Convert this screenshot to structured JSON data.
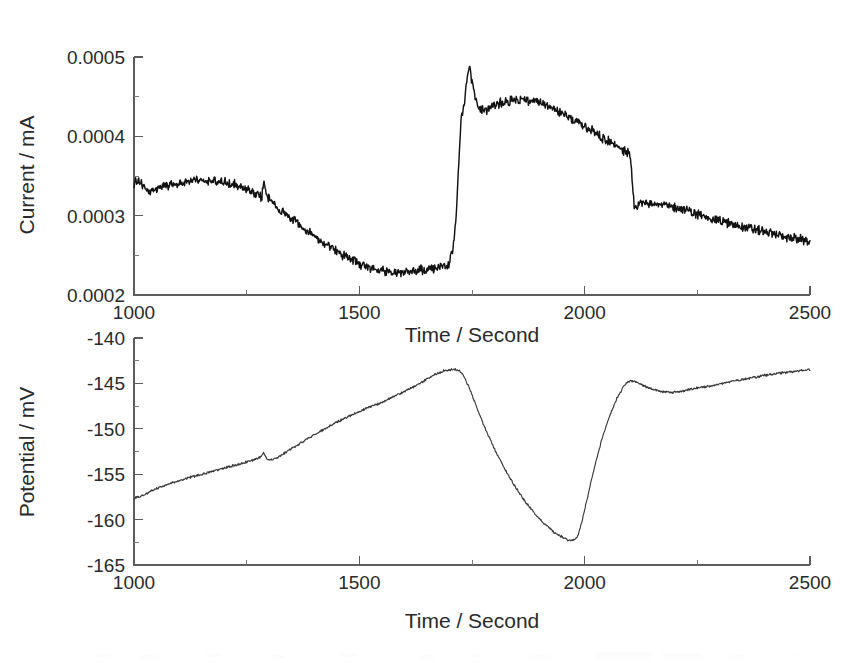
{
  "figure": {
    "background_color": "#ffffff",
    "trace_color": "#121212",
    "axis_color": "#5d5d5d",
    "panel_count": 2
  },
  "chart_data": [
    {
      "type": "line",
      "panel": "top",
      "title": "",
      "xlabel": "Time / Second",
      "ylabel": "Current / mA",
      "xlim": [
        1000,
        2500
      ],
      "ylim": [
        0.0002,
        0.0005
      ],
      "xticks": [
        1000,
        1500,
        2000,
        2500
      ],
      "xtick_labels": [
        "1000",
        "1500",
        "2000",
        "2500"
      ],
      "yticks": [
        0.0002,
        0.0003,
        0.0004,
        0.0005
      ],
      "ytick_labels": [
        "0.0002",
        "0.0003",
        "0.0004",
        "0.0005"
      ],
      "xminor_ticks": [
        1250,
        1750,
        2250
      ],
      "yminor_ticks": [
        0.00025,
        0.00035,
        0.00045
      ],
      "grid": false,
      "legend": "none",
      "noise_amplitude_mA": 5.5e-06,
      "series": [
        {
          "name": "Current",
          "x": [
            1000,
            1010,
            1020,
            1030,
            1045,
            1060,
            1080,
            1100,
            1120,
            1140,
            1160,
            1180,
            1200,
            1220,
            1240,
            1255,
            1270,
            1283,
            1288,
            1292,
            1300,
            1315,
            1335,
            1355,
            1380,
            1405,
            1430,
            1455,
            1480,
            1505,
            1530,
            1555,
            1580,
            1605,
            1630,
            1655,
            1675,
            1690,
            1700,
            1708,
            1715,
            1720,
            1726,
            1732,
            1738,
            1744,
            1752,
            1762,
            1775,
            1790,
            1805,
            1825,
            1845,
            1865,
            1885,
            1905,
            1925,
            1945,
            1965,
            1985,
            2005,
            2025,
            2045,
            2065,
            2085,
            2095,
            2100,
            2104,
            2110,
            2125,
            2145,
            2165,
            2185,
            2205,
            2230,
            2255,
            2285,
            2315,
            2345,
            2375,
            2405,
            2435,
            2465,
            2500
          ],
          "y": [
            0.00034,
            0.000344,
            0.000336,
            0.000329,
            0.000333,
            0.000336,
            0.000339,
            0.000341,
            0.000344,
            0.000345,
            0.000344,
            0.000343,
            0.000342,
            0.000339,
            0.000336,
            0.000332,
            0.000327,
            0.000322,
            0.000344,
            0.00033,
            0.000321,
            0.000313,
            0.000303,
            0.000294,
            0.000283,
            0.000272,
            0.000262,
            0.000253,
            0.000245,
            0.000238,
            0.000233,
            0.00023,
            0.000229,
            0.000229,
            0.000231,
            0.000233,
            0.000234,
            0.000236,
            0.00024,
            0.000258,
            0.0003,
            0.00036,
            0.000424,
            0.000436,
            0.000468,
            0.000491,
            0.000462,
            0.000438,
            0.000432,
            0.000436,
            0.000441,
            0.000444,
            0.000446,
            0.000446,
            0.000444,
            0.000441,
            0.000436,
            0.00043,
            0.000424,
            0.000418,
            0.000411,
            0.000404,
            0.000397,
            0.00039,
            0.000383,
            0.000379,
            0.000376,
            0.000356,
            0.000308,
            0.000316,
            0.000317,
            0.000315,
            0.000312,
            0.00031,
            0.000306,
            0.000301,
            0.000296,
            0.000291,
            0.000287,
            0.000283,
            0.000279,
            0.000275,
            0.000271,
            0.000268
          ]
        }
      ],
      "features": [
        {
          "label": "initial plateau",
          "t_range": [
            1000,
            1250
          ],
          "value_mA": 0.000342
        },
        {
          "label": "upward current spike",
          "t": 1288,
          "value_mA": 0.000344
        },
        {
          "label": "decay to minimum",
          "t_range": [
            1290,
            1600
          ],
          "value_mA": 0.000229
        },
        {
          "label": "sharp step rise",
          "t_range": [
            1705,
            1744
          ],
          "value_mA": 0.000491
        },
        {
          "label": "peak maximum",
          "t": 1744,
          "value_mA": 0.000491
        },
        {
          "label": "broad secondary maximum",
          "t_range": [
            1840,
            1870
          ],
          "value_mA": 0.000446
        },
        {
          "label": "downward current spike",
          "t": 2100,
          "value_mA": 0.000308
        },
        {
          "label": "final value",
          "t": 2500,
          "value_mA": 0.000268
        }
      ]
    },
    {
      "type": "line",
      "panel": "bottom",
      "title": "",
      "xlabel": "Time / Second",
      "ylabel": "Potential / mV",
      "xlim": [
        1000,
        2500
      ],
      "ylim": [
        -165,
        -140
      ],
      "xticks": [
        1000,
        1500,
        2000,
        2500
      ],
      "xtick_labels": [
        "1000",
        "1500",
        "2000",
        "2500"
      ],
      "yticks": [
        -165,
        -160,
        -155,
        -150,
        -145,
        -140
      ],
      "ytick_labels": [
        "-165",
        "-160",
        "-155",
        "-150",
        "-145",
        "-140"
      ],
      "xminor_ticks": [
        1250,
        1750,
        2250
      ],
      "yminor_ticks": [
        -162.5,
        -157.5,
        -152.5,
        -147.5,
        -142.5
      ],
      "grid": false,
      "legend": "none",
      "noise_amplitude_mV": 0.12,
      "series": [
        {
          "name": "Potential",
          "x": [
            1000,
            1020,
            1045,
            1070,
            1095,
            1120,
            1150,
            1180,
            1210,
            1240,
            1265,
            1282,
            1288,
            1294,
            1302,
            1315,
            1330,
            1350,
            1372,
            1395,
            1420,
            1445,
            1470,
            1495,
            1520,
            1545,
            1570,
            1595,
            1620,
            1645,
            1668,
            1688,
            1700,
            1712,
            1722,
            1732,
            1745,
            1760,
            1778,
            1798,
            1820,
            1845,
            1868,
            1890,
            1912,
            1932,
            1950,
            1962,
            1972,
            1978,
            1985,
            1995,
            2008,
            2022,
            2038,
            2055,
            2072,
            2088,
            2100,
            2112,
            2128,
            2148,
            2168,
            2190,
            2215,
            2240,
            2265,
            2295,
            2325,
            2355,
            2390,
            2425,
            2460,
            2500
          ],
          "y": [
            -157.7,
            -157.3,
            -156.7,
            -156.2,
            -155.8,
            -155.4,
            -155.0,
            -154.6,
            -154.2,
            -153.8,
            -153.4,
            -153.1,
            -152.6,
            -153.3,
            -153.4,
            -153.2,
            -152.8,
            -152.2,
            -151.5,
            -150.8,
            -150.1,
            -149.4,
            -148.8,
            -148.2,
            -147.6,
            -147.2,
            -146.6,
            -146.0,
            -145.4,
            -144.7,
            -144.0,
            -143.6,
            -143.5,
            -143.5,
            -143.6,
            -144.2,
            -145.6,
            -147.6,
            -149.8,
            -152.0,
            -154.2,
            -156.3,
            -158.0,
            -159.4,
            -160.5,
            -161.4,
            -161.9,
            -162.2,
            -162.3,
            -162.2,
            -161.8,
            -160.0,
            -157.2,
            -154.2,
            -151.2,
            -148.6,
            -146.6,
            -145.2,
            -144.7,
            -144.8,
            -145.2,
            -145.6,
            -145.9,
            -146.0,
            -145.9,
            -145.6,
            -145.4,
            -145.1,
            -144.8,
            -144.5,
            -144.2,
            -143.9,
            -143.7,
            -143.5
          ]
        }
      ],
      "features": [
        {
          "label": "start value",
          "t": 1000,
          "value_mV": -157.7
        },
        {
          "label": "small positive blip",
          "t": 1288,
          "value_mV": -152.6
        },
        {
          "label": "rising ramp maximum",
          "t_range": [
            1688,
            1715
          ],
          "value_mV": -143.5
        },
        {
          "label": "deep negative minimum",
          "t_range": [
            1950,
            1978
          ],
          "value_mV": -162.3
        },
        {
          "label": "recovery overshoot",
          "t": 2100,
          "value_mV": -144.7
        },
        {
          "label": "shallow secondary dip",
          "t": 2190,
          "value_mV": -146.0
        },
        {
          "label": "final value",
          "t": 2500,
          "value_mV": -143.5
        }
      ]
    }
  ]
}
